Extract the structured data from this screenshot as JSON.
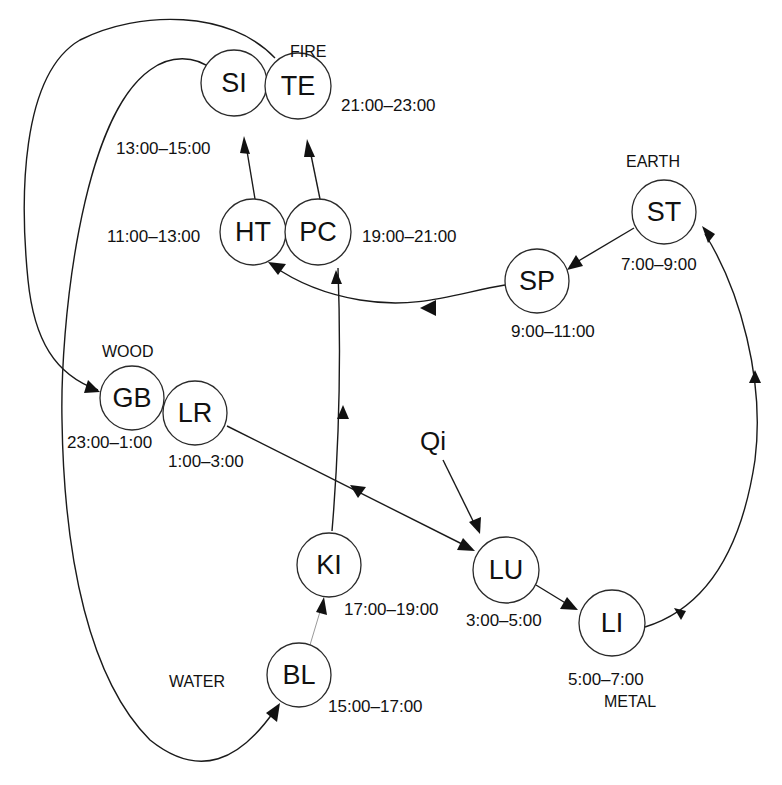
{
  "diagram": {
    "center_label": "Qi",
    "elements": {
      "fire": "FIRE",
      "earth": "EARTH",
      "wood": "WOOD",
      "water": "WATER",
      "metal": "METAL"
    },
    "nodes": {
      "SI": {
        "label": "SI",
        "time": "13:00–15:00"
      },
      "TE": {
        "label": "TE",
        "time": "21:00–23:00"
      },
      "HT": {
        "label": "HT",
        "time": "11:00–13:00"
      },
      "PC": {
        "label": "PC",
        "time": "19:00–21:00"
      },
      "ST": {
        "label": "ST",
        "time": "7:00–9:00"
      },
      "SP": {
        "label": "SP",
        "time": "9:00–11:00"
      },
      "GB": {
        "label": "GB",
        "time": "23:00–1:00"
      },
      "LR": {
        "label": "LR",
        "time": "1:00–3:00"
      },
      "KI": {
        "label": "KI",
        "time": "17:00–19:00"
      },
      "LU": {
        "label": "LU",
        "time": "3:00–5:00"
      },
      "LI": {
        "label": "LI",
        "time": "5:00–7:00"
      },
      "BL": {
        "label": "BL",
        "time": "15:00–17:00"
      }
    },
    "edges": [
      {
        "from": "Qi",
        "to": "LU"
      },
      {
        "from": "LU",
        "to": "LI"
      },
      {
        "from": "LI",
        "to": "ST"
      },
      {
        "from": "ST",
        "to": "SP"
      },
      {
        "from": "SP",
        "to": "HT"
      },
      {
        "from": "HT",
        "to": "SI"
      },
      {
        "from": "SI",
        "to": "BL"
      },
      {
        "from": "BL",
        "to": "KI"
      },
      {
        "from": "KI",
        "to": "PC"
      },
      {
        "from": "PC",
        "to": "TE"
      },
      {
        "from": "TE",
        "to": "GB"
      },
      {
        "from": "LR",
        "to": "LU"
      }
    ]
  }
}
